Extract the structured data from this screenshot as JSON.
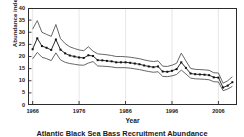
{
  "figure": {
    "caption": "Atlantic Black Sea Bass Recruitment Abundance",
    "ylabel": "Abundance index",
    "xlabel": "Year"
  },
  "chart_data": {
    "type": "line",
    "title": "",
    "subtitle": "",
    "xlabel": "Year",
    "ylabel": "Abundance index",
    "xlim": [
      1965,
      2010
    ],
    "ylim": [
      0,
      40
    ],
    "grid": "vertical-faint",
    "legend_position": "none",
    "x_ticks": [
      1966,
      1976,
      1986,
      1996,
      2006
    ],
    "y_ticks": [
      0,
      5,
      10,
      15,
      20,
      25,
      30,
      35,
      40
    ],
    "x": [
      1966,
      1967,
      1968,
      1969,
      1970,
      1971,
      1972,
      1973,
      1974,
      1975,
      1976,
      1977,
      1978,
      1979,
      1980,
      1981,
      1982,
      1983,
      1984,
      1985,
      1986,
      1987,
      1988,
      1989,
      1990,
      1991,
      1992,
      1993,
      1994,
      1995,
      1996,
      1997,
      1998,
      1999,
      2000,
      2001,
      2002,
      2003,
      2004,
      2005,
      2006,
      2007,
      2008,
      2009
    ],
    "series": [
      {
        "name": "Abundance index",
        "style": "line-with-square-markers",
        "color": "#111111",
        "values": [
          23.0,
          27.5,
          24.3,
          23.6,
          22.7,
          27.0,
          22.8,
          21.3,
          20.4,
          20.0,
          19.6,
          19.4,
          20.5,
          20.2,
          18.5,
          18.4,
          18.2,
          18.0,
          17.6,
          17.6,
          17.6,
          17.4,
          17.1,
          16.8,
          16.3,
          15.9,
          15.6,
          15.9,
          13.8,
          13.7,
          14.1,
          14.8,
          17.6,
          15.3,
          13.0,
          12.7,
          12.6,
          12.5,
          12.3,
          11.4,
          11.3,
          7.2,
          8.0,
          9.4
        ]
      },
      {
        "name": "Upper confidence bound",
        "style": "line",
        "color": "#555555",
        "values": [
          31.3,
          34.8,
          30.0,
          29.1,
          28.3,
          33.2,
          27.4,
          25.3,
          24.0,
          23.3,
          22.7,
          22.4,
          24.0,
          22.2,
          21.1,
          20.9,
          20.7,
          20.4,
          20.0,
          20.0,
          19.9,
          19.7,
          19.4,
          19.1,
          18.6,
          18.2,
          17.9,
          18.2,
          16.0,
          15.9,
          16.4,
          17.2,
          21.4,
          18.2,
          15.1,
          14.7,
          14.6,
          14.5,
          14.3,
          13.3,
          13.2,
          9.0,
          10.0,
          11.7
        ]
      },
      {
        "name": "Lower confidence bound",
        "style": "line",
        "color": "#555555",
        "values": [
          19.0,
          21.7,
          19.7,
          19.1,
          18.3,
          21.5,
          18.6,
          17.6,
          17.1,
          16.8,
          16.5,
          16.4,
          17.3,
          17.9,
          16.1,
          16.0,
          15.9,
          15.7,
          15.4,
          15.4,
          15.4,
          15.2,
          14.9,
          14.6,
          14.2,
          13.8,
          13.5,
          13.7,
          11.8,
          11.7,
          12.0,
          12.6,
          14.4,
          12.8,
          11.1,
          10.8,
          10.7,
          10.6,
          10.4,
          9.6,
          9.5,
          5.9,
          6.6,
          7.7
        ]
      }
    ]
  }
}
